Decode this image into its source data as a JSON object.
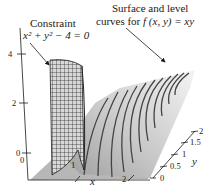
{
  "figure": {
    "type": "3d-surface-plot",
    "function": "f(x, y) = xy",
    "constraint": "x^2 + y^2 - 4 = 0"
  },
  "annotations": {
    "constraint_title": "Constraint",
    "constraint_equation": "x² + y² − 4 = 0",
    "surface_line1": "Surface and level",
    "surface_line2_prefix": "curves for ",
    "surface_function": "f (x, y) = xy"
  },
  "axes": {
    "x": {
      "label": "x",
      "ticks": [
        "0",
        "1",
        "2"
      ]
    },
    "y": {
      "label": "y",
      "ticks": [
        "0",
        "0.5",
        "1",
        "1.5",
        "2"
      ]
    },
    "z": {
      "label": "",
      "ticks": [
        "0",
        "2",
        "4"
      ]
    }
  },
  "colors": {
    "surface_light": "#f2f2f2",
    "surface_dark": "#a8a8a8",
    "base_plane": "#b5b5b5",
    "level_curve": "#444444",
    "mesh": "#222222"
  }
}
